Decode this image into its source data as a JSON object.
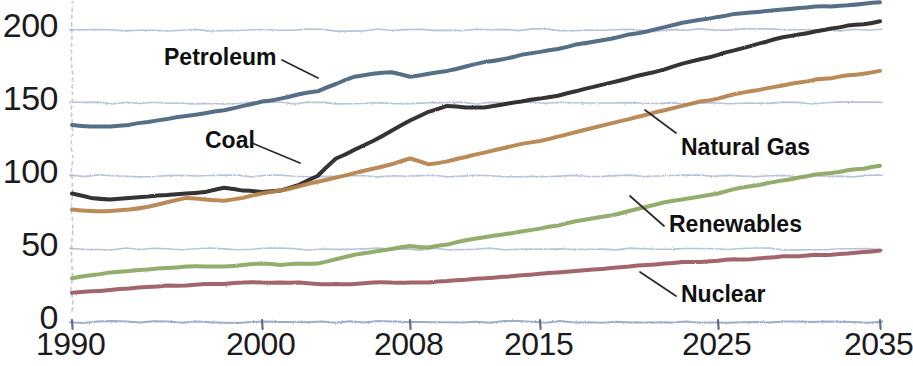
{
  "chart_data": {
    "type": "line",
    "title": "",
    "subtitle": "",
    "xlabel": "",
    "ylabel": "",
    "xlim": [
      1990,
      2035
    ],
    "ylim": [
      0,
      215
    ],
    "grid": true,
    "grid_axis": "y",
    "legend_position": "inline-annotations",
    "style": "hand-drawn sketch, pencil-textured lines on white",
    "x": [
      1990,
      1991,
      1992,
      1993,
      1994,
      1995,
      1996,
      1997,
      1998,
      1999,
      2000,
      2001,
      2002,
      2003,
      2004,
      2005,
      2006,
      2007,
      2008,
      2009,
      2010,
      2011,
      2012,
      2013,
      2014,
      2015,
      2016,
      2017,
      2018,
      2019,
      2020,
      2021,
      2022,
      2023,
      2024,
      2025,
      2026,
      2027,
      2028,
      2029,
      2030,
      2031,
      2032,
      2033,
      2034,
      2035
    ],
    "xticks": [
      1990,
      2000,
      2008,
      2015,
      2025,
      2035
    ],
    "xtick_labels": [
      "1990",
      "2000",
      "2008",
      "2015",
      "2025",
      "2035"
    ],
    "yticks": [
      0,
      50,
      100,
      150,
      200
    ],
    "ytick_labels": [
      "0",
      "50",
      "100",
      "150",
      "200"
    ],
    "series": [
      {
        "name": "Petroleum",
        "color": "#4a6480",
        "label_anchor": {
          "x": 2003,
          "y": 170
        },
        "values": [
          135,
          134,
          134,
          135,
          137,
          139,
          141,
          143,
          145,
          148,
          151,
          153,
          156,
          158,
          163,
          168,
          170,
          171,
          168,
          170,
          172,
          175,
          178,
          180,
          183,
          185,
          187,
          190,
          192,
          194,
          197,
          199,
          202,
          205,
          207,
          209,
          211,
          212,
          213,
          214,
          215,
          216,
          216,
          217,
          218,
          219
        ]
      },
      {
        "name": "Coal",
        "color": "#262321",
        "label_anchor": {
          "x": 2003,
          "y": 131
        },
        "values": [
          88,
          85,
          84,
          85,
          86,
          87,
          88,
          89,
          92,
          90,
          89,
          90,
          94,
          100,
          112,
          118,
          124,
          131,
          138,
          144,
          148,
          147,
          147,
          149,
          151,
          153,
          155,
          158,
          161,
          164,
          167,
          170,
          173,
          177,
          180,
          183,
          186,
          189,
          192,
          195,
          197,
          199,
          201,
          203,
          204,
          206
        ]
      },
      {
        "name": "Natural Gas",
        "color": "#b5824a",
        "label_anchor": {
          "x": 2022,
          "y": 130
        },
        "values": [
          77,
          76,
          76,
          77,
          79,
          82,
          85,
          84,
          83,
          85,
          88,
          90,
          93,
          96,
          99,
          102,
          105,
          108,
          112,
          108,
          110,
          113,
          116,
          119,
          122,
          124,
          127,
          130,
          133,
          136,
          139,
          142,
          145,
          148,
          151,
          153,
          156,
          158,
          160,
          162,
          164,
          166,
          167,
          169,
          170,
          172
        ]
      },
      {
        "name": "Renewables",
        "color": "#8ba760",
        "label_anchor": {
          "x": 2022,
          "y": 70
        },
        "values": [
          30,
          32,
          34,
          35,
          36,
          37,
          38,
          38,
          38,
          39,
          40,
          39,
          40,
          40,
          43,
          46,
          48,
          50,
          52,
          51,
          53,
          56,
          58,
          60,
          62,
          64,
          66,
          69,
          71,
          73,
          76,
          79,
          82,
          84,
          86,
          88,
          91,
          93,
          95,
          97,
          99,
          101,
          102,
          104,
          105,
          107
        ]
      },
      {
        "name": "Nuclear",
        "color": "#9c5a62",
        "label_anchor": {
          "x": 2022,
          "y": 22
        },
        "values": [
          20,
          21,
          22,
          23,
          24,
          25,
          25,
          26,
          26,
          27,
          27,
          27,
          27,
          26,
          26,
          26,
          27,
          27,
          27,
          27,
          28,
          29,
          30,
          31,
          32,
          33,
          34,
          35,
          36,
          37,
          38,
          39,
          40,
          41,
          41,
          42,
          43,
          43,
          44,
          45,
          45,
          46,
          46,
          47,
          48,
          49
        ]
      }
    ],
    "annotations": [
      {
        "text": "Petroleum",
        "series": "Petroleum",
        "leader": true
      },
      {
        "text": "Coal",
        "series": "Coal",
        "leader": true
      },
      {
        "text": "Natural Gas",
        "series": "Natural Gas",
        "leader": true
      },
      {
        "text": "Renewables",
        "series": "Renewables",
        "leader": true
      },
      {
        "text": "Nuclear",
        "series": "Nuclear",
        "leader": true
      }
    ],
    "axis_color": "#8d9ec4",
    "text_color": "#1b1b1b"
  },
  "labels": {
    "petroleum": "Petroleum",
    "coal": "Coal",
    "natural_gas": "Natural Gas",
    "renewables": "Renewables",
    "nuclear": "Nuclear"
  },
  "yticks": {
    "t0": "0",
    "t1": "50",
    "t2": "100",
    "t3": "150",
    "t4": "200"
  },
  "xticks": {
    "t0": "1990",
    "t1": "2000",
    "t2": "2008",
    "t3": "2015",
    "t4": "2025",
    "t5": "2035"
  }
}
